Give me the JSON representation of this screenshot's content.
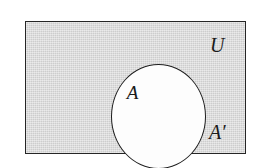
{
  "figure": {
    "name": "venn-diagram-complement",
    "labels": {
      "set": "A",
      "universe": "U",
      "complement": "A′"
    },
    "colors": {
      "shading": "#d6d6d6",
      "set_fill": "#fdfdfd",
      "stroke": "#1d1d1d",
      "page_background": "#ffffff"
    }
  },
  "chart_data": {
    "type": "diagram",
    "diagram_kind": "venn",
    "title": "",
    "regions": [
      {
        "id": "universe",
        "label": "U",
        "shape": "rectangle",
        "shaded": true,
        "fill": "#d6d6d6",
        "x": 25,
        "y": 21,
        "width": 221,
        "height": 133
      },
      {
        "id": "set-a",
        "label": "A",
        "shape": "ellipse",
        "shaded": false,
        "fill": "#fdfdfd",
        "cx": 132,
        "cy": 94,
        "rx": 47,
        "ry": 52
      },
      {
        "id": "a-complement",
        "label": "A′",
        "shape": "rectangle-minus-ellipse",
        "shaded": true,
        "fill": "#d6d6d6"
      }
    ],
    "legend": [],
    "annotations": [
      "A",
      "U",
      "A′"
    ]
  }
}
